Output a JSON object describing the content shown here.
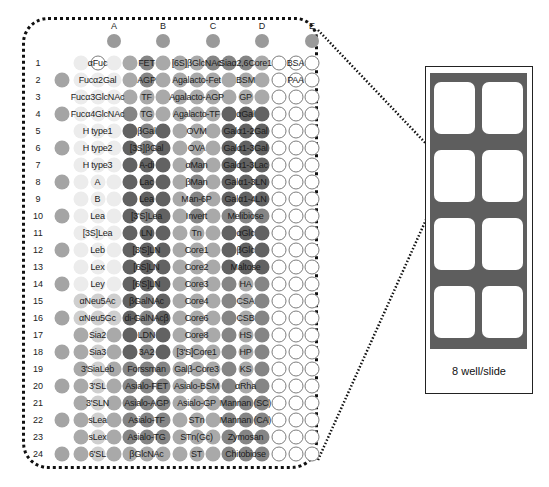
{
  "columns": [
    "A",
    "B",
    "C",
    "D",
    "E"
  ],
  "rows": [
    {
      "n": "1",
      "marker": false,
      "shades": [
        1,
        0,
        1,
        3,
        4,
        3,
        3,
        3,
        4,
        4,
        4,
        3,
        0,
        0,
        0
      ],
      "labels": [
        "αFuc",
        "FET",
        "[6S]βGlcNAc",
        "Siaα2,6Core1",
        "BSA"
      ]
    },
    {
      "n": "2",
      "marker": true,
      "shades": [
        1,
        1,
        1,
        3,
        4,
        3,
        3,
        3,
        3,
        3,
        3,
        3,
        0,
        0,
        0
      ],
      "labels": [
        "Fucα2Gal",
        "AGP",
        "Agalacto-Fet",
        "BSM",
        "PAA"
      ]
    },
    {
      "n": "3",
      "marker": false,
      "shades": [
        1,
        1,
        1,
        3,
        3,
        3,
        3,
        3,
        3,
        3,
        3,
        3,
        0,
        0,
        0
      ],
      "labels": [
        "Fucα3GlcNAc",
        "TF",
        "Agalacto-AGP",
        "GP",
        ""
      ]
    },
    {
      "n": "4",
      "marker": true,
      "shades": [
        1,
        1,
        1,
        4,
        3,
        3,
        3,
        3,
        3,
        5,
        5,
        5,
        0,
        0,
        0
      ],
      "labels": [
        "Fucα4GlcNAc",
        "TG",
        "Agalacto-TF",
        "αGal",
        ""
      ]
    },
    {
      "n": "5",
      "marker": false,
      "shades": [
        1,
        1,
        1,
        5,
        4,
        5,
        3,
        3,
        3,
        5,
        5,
        5,
        0,
        0,
        0
      ],
      "labels": [
        "H type1",
        "βGal",
        "OVM",
        "Galα1-2Gal",
        ""
      ]
    },
    {
      "n": "6",
      "marker": true,
      "shades": [
        1,
        1,
        1,
        5,
        4,
        5,
        3,
        3,
        3,
        5,
        5,
        5,
        0,
        0,
        0
      ],
      "labels": [
        "H type2",
        "[3S]βGal",
        "OVA",
        "Galα1-3Gal",
        ""
      ]
    },
    {
      "n": "7",
      "marker": false,
      "shades": [
        1,
        1,
        1,
        5,
        5,
        5,
        3,
        4,
        3,
        5,
        5,
        5,
        0,
        0,
        0
      ],
      "labels": [
        "H type3",
        "A-di",
        "αMan",
        "Galα1-3Lac",
        ""
      ]
    },
    {
      "n": "8",
      "marker": true,
      "shades": [
        1,
        1,
        1,
        5,
        5,
        5,
        3,
        4,
        3,
        5,
        5,
        5,
        0,
        0,
        0
      ],
      "labels": [
        "A",
        "Lac",
        "βMan",
        "Galα1-3LN",
        ""
      ]
    },
    {
      "n": "9",
      "marker": false,
      "shades": [
        1,
        1,
        1,
        5,
        5,
        5,
        3,
        4,
        3,
        5,
        5,
        5,
        0,
        0,
        0
      ],
      "labels": [
        "B",
        "Lea",
        "Man-6P",
        "Galα1-4LN",
        ""
      ]
    },
    {
      "n": "10",
      "marker": true,
      "shades": [
        1,
        1,
        1,
        5,
        4,
        5,
        3,
        4,
        3,
        4,
        4,
        4,
        0,
        0,
        0
      ],
      "labels": [
        "Lea",
        "[3'S]Lea",
        "Invert",
        "Melibiose",
        ""
      ]
    },
    {
      "n": "11",
      "marker": false,
      "shades": [
        1,
        1,
        1,
        5,
        5,
        5,
        3,
        3,
        3,
        5,
        5,
        5,
        0,
        0,
        0
      ],
      "labels": [
        "[3S]Lea",
        "LN",
        "Tn",
        "αGlc",
        ""
      ]
    },
    {
      "n": "12",
      "marker": true,
      "shades": [
        1,
        1,
        1,
        5,
        5,
        5,
        3,
        3,
        3,
        5,
        5,
        5,
        0,
        0,
        0
      ],
      "labels": [
        "Leb",
        "[3'S]LN",
        "Core1",
        "βGlc",
        ""
      ]
    },
    {
      "n": "13",
      "marker": false,
      "shades": [
        1,
        1,
        1,
        5,
        5,
        5,
        3,
        3,
        3,
        5,
        5,
        5,
        0,
        0,
        0
      ],
      "labels": [
        "Lex",
        "[6S]LN",
        "Core2",
        "Maltose",
        ""
      ]
    },
    {
      "n": "14",
      "marker": true,
      "shades": [
        1,
        1,
        1,
        5,
        5,
        5,
        3,
        3,
        3,
        4,
        3,
        4,
        0,
        0,
        0
      ],
      "labels": [
        "Ley",
        "[6'S]LN",
        "Core3",
        "HA",
        ""
      ]
    },
    {
      "n": "15",
      "marker": false,
      "shades": [
        2,
        2,
        2,
        5,
        4,
        5,
        3,
        3,
        3,
        4,
        3,
        4,
        0,
        0,
        0
      ],
      "labels": [
        "αNeu5Ac",
        "βGalNAc",
        "Core4",
        "CSA",
        ""
      ]
    },
    {
      "n": "16",
      "marker": true,
      "shades": [
        2,
        2,
        2,
        5,
        4,
        5,
        3,
        3,
        3,
        4,
        3,
        4,
        0,
        0,
        0
      ],
      "labels": [
        "αNeu5Gc",
        "di-GalNAcβ",
        "Core6",
        "CSB",
        ""
      ]
    },
    {
      "n": "17",
      "marker": false,
      "shades": [
        3,
        2,
        3,
        5,
        4,
        5,
        3,
        3,
        3,
        4,
        3,
        4,
        0,
        0,
        0
      ],
      "labels": [
        "Sia2",
        "LDN",
        "Core8",
        "HS",
        ""
      ]
    },
    {
      "n": "18",
      "marker": true,
      "shades": [
        3,
        2,
        3,
        5,
        4,
        5,
        3,
        3,
        3,
        4,
        3,
        4,
        0,
        0,
        0
      ],
      "labels": [
        "Sia3",
        "3A2",
        "[3'S]Core1",
        "HP",
        ""
      ]
    },
    {
      "n": "19",
      "marker": false,
      "shades": [
        3,
        2,
        3,
        4,
        4,
        4,
        3,
        3,
        3,
        4,
        3,
        4,
        0,
        0,
        0
      ],
      "labels": [
        "3'SiaLeb",
        "Forssman",
        "Galβ-Core3",
        "KS",
        ""
      ]
    },
    {
      "n": "20",
      "marker": true,
      "shades": [
        3,
        2,
        3,
        4,
        4,
        4,
        3,
        3,
        3,
        4,
        3,
        4,
        0,
        0,
        0
      ],
      "labels": [
        "3'SL",
        "Asialo-FET",
        "Asialo-BSM",
        "αRha",
        ""
      ]
    },
    {
      "n": "21",
      "marker": false,
      "shades": [
        3,
        2,
        3,
        4,
        4,
        4,
        3,
        3,
        3,
        4,
        4,
        4,
        0,
        0,
        0
      ],
      "labels": [
        "3'SLN",
        "Asialo-AGP",
        "Asialo-GP",
        "Mannan (SC)",
        ""
      ]
    },
    {
      "n": "22",
      "marker": true,
      "shades": [
        3,
        2,
        3,
        4,
        4,
        4,
        3,
        3,
        3,
        4,
        4,
        4,
        0,
        0,
        0
      ],
      "labels": [
        "sLea",
        "Asialo-TF",
        "STn",
        "Mannan (CA)",
        ""
      ]
    },
    {
      "n": "23",
      "marker": false,
      "shades": [
        3,
        2,
        3,
        4,
        4,
        4,
        3,
        3,
        3,
        4,
        4,
        4,
        0,
        0,
        0
      ],
      "labels": [
        "sLex",
        "Asialo-TG",
        "STn(Gc)",
        "Zymosan",
        ""
      ]
    },
    {
      "n": "24",
      "marker": true,
      "shades": [
        3,
        2,
        3,
        3,
        3,
        3,
        3,
        3,
        3,
        4,
        4,
        4,
        0,
        0,
        0
      ],
      "labels": [
        "6'SL",
        "βGlcNAc",
        "ST",
        "Chitobiose",
        ""
      ]
    }
  ],
  "slide": {
    "label": "8 well/slide",
    "wells": 8
  }
}
